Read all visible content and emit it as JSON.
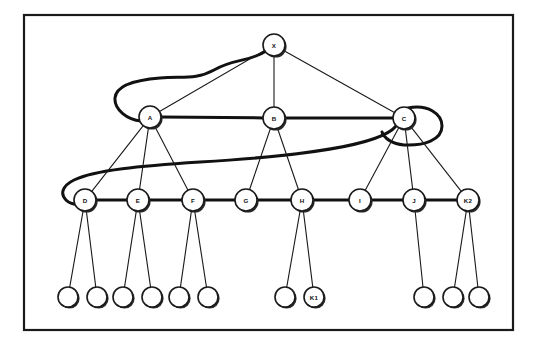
{
  "diagram": {
    "frame": {
      "x": 24,
      "y": 15,
      "width": 489,
      "height": 315
    },
    "stroke_color": "#1a1a1a",
    "background_color": "#ffffff",
    "node_radius": 11,
    "leaf_radius": 10,
    "nodes": [
      {
        "id": "X",
        "label": "X",
        "x": 274,
        "y": 45,
        "r": 11,
        "level": "root"
      },
      {
        "id": "A",
        "label": "A",
        "x": 150,
        "y": 117,
        "r": 11,
        "level": "branch"
      },
      {
        "id": "B",
        "label": "B",
        "x": 274,
        "y": 118,
        "r": 11,
        "level": "branch"
      },
      {
        "id": "C",
        "label": "C",
        "x": 404,
        "y": 118,
        "r": 11,
        "level": "branch"
      },
      {
        "id": "D",
        "label": "D",
        "x": 85,
        "y": 200,
        "r": 11,
        "level": "mid"
      },
      {
        "id": "E",
        "label": "E",
        "x": 138,
        "y": 200,
        "r": 11,
        "level": "mid"
      },
      {
        "id": "F",
        "label": "F",
        "x": 193,
        "y": 200,
        "r": 11,
        "level": "mid"
      },
      {
        "id": "G",
        "label": "G",
        "x": 246,
        "y": 200,
        "r": 11,
        "level": "mid"
      },
      {
        "id": "H",
        "label": "H",
        "x": 302,
        "y": 200,
        "r": 11,
        "level": "mid"
      },
      {
        "id": "I",
        "label": "I",
        "x": 360,
        "y": 200,
        "r": 11,
        "level": "mid"
      },
      {
        "id": "J",
        "label": "J",
        "x": 414,
        "y": 200,
        "r": 11,
        "level": "mid"
      },
      {
        "id": "K2",
        "label": "K2",
        "x": 468,
        "y": 200,
        "r": 11,
        "level": "mid"
      },
      {
        "id": "L1",
        "label": "",
        "x": 68,
        "y": 297,
        "r": 10,
        "level": "leaf"
      },
      {
        "id": "L2",
        "label": "",
        "x": 97,
        "y": 297,
        "r": 10,
        "level": "leaf"
      },
      {
        "id": "L3",
        "label": "",
        "x": 123,
        "y": 297,
        "r": 10,
        "level": "leaf"
      },
      {
        "id": "L4",
        "label": "",
        "x": 152,
        "y": 297,
        "r": 10,
        "level": "leaf"
      },
      {
        "id": "L5",
        "label": "",
        "x": 179,
        "y": 297,
        "r": 10,
        "level": "leaf"
      },
      {
        "id": "L6",
        "label": "",
        "x": 208,
        "y": 297,
        "r": 10,
        "level": "leaf"
      },
      {
        "id": "L7",
        "label": "",
        "x": 285,
        "y": 297,
        "r": 10,
        "level": "leaf"
      },
      {
        "id": "K1",
        "label": "K1",
        "x": 314,
        "y": 297,
        "r": 10,
        "level": "leaf"
      },
      {
        "id": "L8",
        "label": "",
        "x": 424,
        "y": 297,
        "r": 10,
        "level": "leaf"
      },
      {
        "id": "L9",
        "label": "",
        "x": 453,
        "y": 297,
        "r": 10,
        "level": "leaf"
      },
      {
        "id": "L10",
        "label": "",
        "x": 479,
        "y": 297,
        "r": 10,
        "level": "leaf"
      }
    ],
    "edges_thin": [
      {
        "from": "X",
        "to": "A"
      },
      {
        "from": "X",
        "to": "B"
      },
      {
        "from": "X",
        "to": "C"
      },
      {
        "from": "A",
        "to": "D"
      },
      {
        "from": "A",
        "to": "E"
      },
      {
        "from": "A",
        "to": "F"
      },
      {
        "from": "B",
        "to": "G"
      },
      {
        "from": "B",
        "to": "H"
      },
      {
        "from": "C",
        "to": "I"
      },
      {
        "from": "C",
        "to": "J"
      },
      {
        "from": "C",
        "to": "K2"
      },
      {
        "from": "D",
        "to": "L1"
      },
      {
        "from": "D",
        "to": "L2"
      },
      {
        "from": "E",
        "to": "L3"
      },
      {
        "from": "E",
        "to": "L4"
      },
      {
        "from": "F",
        "to": "L5"
      },
      {
        "from": "F",
        "to": "L6"
      },
      {
        "from": "H",
        "to": "L7"
      },
      {
        "from": "H",
        "to": "K1"
      },
      {
        "from": "J",
        "to": "L8"
      },
      {
        "from": "K2",
        "to": "L9"
      },
      {
        "from": "K2",
        "to": "L10"
      }
    ],
    "edges_thick": [
      {
        "from": "A",
        "to": "B"
      },
      {
        "from": "B",
        "to": "C"
      },
      {
        "from": "D",
        "to": "E"
      },
      {
        "from": "E",
        "to": "F"
      },
      {
        "from": "F",
        "to": "G"
      },
      {
        "from": "G",
        "to": "H"
      },
      {
        "from": "H",
        "to": "I"
      },
      {
        "from": "I",
        "to": "J"
      },
      {
        "from": "J",
        "to": "K2"
      }
    ],
    "curved_links": [
      {
        "name": "loop-x-to-a",
        "from": "X",
        "to": "A",
        "path": "M 266 51 C 250 62 235 58 214 70 C 196 80 182 76 160 78 C 134 80 116 86 115 98 C 114 110 128 120 141 121"
      },
      {
        "name": "sweep-d-to-c",
        "from": "D",
        "to": "C",
        "path": "M 396 126 C 380 146 300 156 200 162 C 140 166 95 170 74 180 C 62 186 60 194 66 200 C 71 205 78 205 85 203"
      },
      {
        "name": "loop-c-right",
        "from": "C",
        "to": "C",
        "path": "M 408 108 C 428 104 442 114 442 126 C 442 140 424 146 404 145 C 392 144 384 138 382 132"
      }
    ]
  }
}
